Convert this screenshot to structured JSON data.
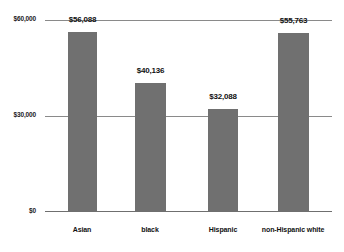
{
  "chart_data": {
    "type": "bar",
    "title": "",
    "subtitle": "",
    "xlabel": "",
    "ylabel": "",
    "categories": [
      "Asian",
      "black",
      "Hispanic",
      "non-Hispanic white"
    ],
    "values": [
      56088,
      40136,
      32088,
      55763
    ],
    "value_labels": [
      "$56,088",
      "$40,136",
      "$32,088",
      "$55,763"
    ],
    "ylim": [
      0,
      60000
    ],
    "yticks": [
      0,
      30000,
      60000
    ],
    "ytick_labels": [
      "$0",
      "$30,000",
      "$60,000"
    ],
    "grid": true,
    "legend": false,
    "legend_position": "none",
    "series": [
      {
        "name": "Median household income",
        "values": [
          56088,
          40136,
          32088,
          55763
        ]
      }
    ],
    "annotations": []
  },
  "style": {
    "bar_color": "#707070",
    "gridline_color": "#8a8a8a",
    "axis_color": "#6f6f6f",
    "text_color": "#111111",
    "background": "#ffffff"
  }
}
